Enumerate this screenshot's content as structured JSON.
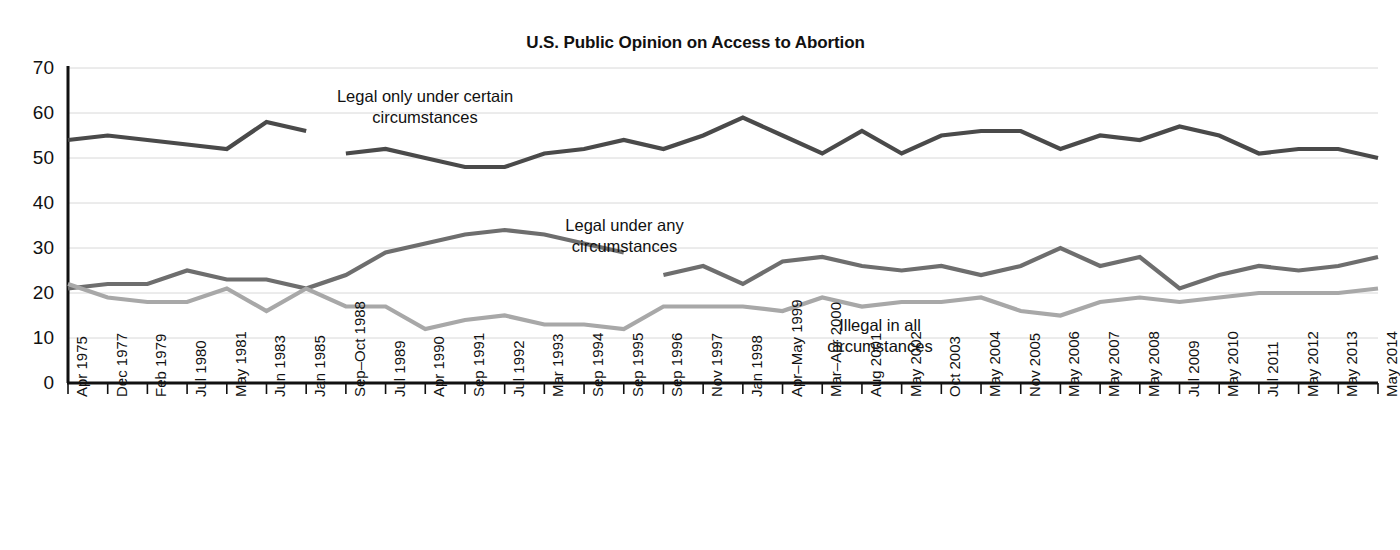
{
  "chart_data": {
    "type": "line",
    "title": "U.S. Public Opinion on Access to Abortion",
    "xlabel": "",
    "ylabel": "",
    "ylim": [
      0,
      70
    ],
    "ytick_step": 10,
    "yticks": [
      70,
      60,
      50,
      40,
      30,
      20,
      10,
      0
    ],
    "grid": true,
    "legend_position": "inline-annotations",
    "categories": [
      "Apr 1975",
      "Dec 1977",
      "Feb 1979",
      "Jul 1980",
      "May 1981",
      "Jun 1983",
      "Jan 1985",
      "Sep–Oct 1988",
      "Jul 1989",
      "Apr 1990",
      "Sep 1991",
      "Jul 1992",
      "Mar 1993",
      "Sep 1994",
      "Sep 1995",
      "Sep 1996",
      "Nov 1997",
      "Jan 1998",
      "Apr–May 1999",
      "Mar–Apr 2000",
      "Aug 2001",
      "May 2002",
      "Oct 2003",
      "May 2004",
      "Nov 2005",
      "May 2006",
      "May 2007",
      "May 2008",
      "Jul 2009",
      "May 2010",
      "Jul 2011",
      "May 2012",
      "May 2013",
      "May 2014"
    ],
    "series": [
      {
        "name": "Legal only under certain circumstances",
        "color": "#4a4a4a",
        "label_lines": [
          "Legal only under certain",
          "circumstances"
        ],
        "values": [
          54,
          55,
          54,
          53,
          52,
          58,
          56,
          51,
          52,
          50,
          48,
          48,
          51,
          52,
          54,
          52,
          55,
          59,
          55,
          51,
          56,
          51,
          55,
          56,
          56,
          52,
          55,
          54,
          57,
          55,
          51,
          52,
          52,
          50
        ]
      },
      {
        "name": "Legal under any circumstances",
        "color": "#6e6e6e",
        "label_lines": [
          "Legal under any",
          "circumstances"
        ],
        "values": [
          21,
          22,
          22,
          25,
          23,
          23,
          21,
          24,
          29,
          31,
          33,
          34,
          33,
          31,
          29,
          24,
          26,
          22,
          27,
          28,
          26,
          25,
          26,
          24,
          26,
          30,
          26,
          28,
          21,
          24,
          26,
          25,
          26,
          28
        ]
      },
      {
        "name": "Illegal in all circumstances",
        "color": "#a8a8a8",
        "label_lines": [
          "Illegal in all",
          "circumstances"
        ],
        "values": [
          22,
          19,
          18,
          18,
          21,
          16,
          21,
          17,
          17,
          12,
          14,
          15,
          13,
          13,
          12,
          17,
          17,
          17,
          16,
          19,
          17,
          18,
          18,
          19,
          16,
          15,
          18,
          19,
          18,
          19,
          20,
          20,
          20,
          21
        ]
      }
    ],
    "series_gaps": [
      {
        "series_index": 0,
        "after_category_index": 6
      },
      {
        "series_index": 1,
        "after_category_index": 14
      }
    ],
    "annotations": [
      {
        "text_lines": [
          "Legal only under certain",
          "circumstances"
        ],
        "for_series": "Legal only under certain circumstances"
      },
      {
        "text_lines": [
          "Legal under any",
          "circumstances"
        ],
        "for_series": "Legal under any circumstances"
      },
      {
        "text_lines": [
          "Illegal in all",
          "circumstances"
        ],
        "for_series": "Illegal in all circumstances"
      }
    ]
  }
}
